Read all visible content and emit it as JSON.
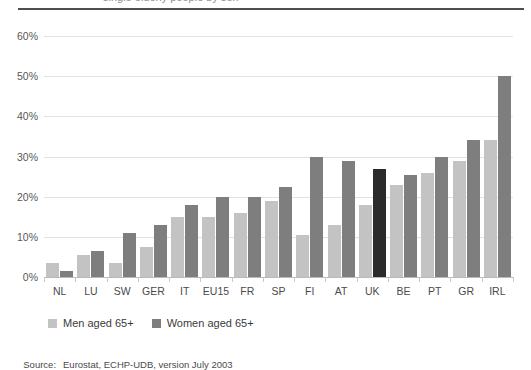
{
  "title_sliver": "single elderly people by sex",
  "chart_data": {
    "type": "bar",
    "title": "",
    "subtitle": "",
    "xlabel": "",
    "ylabel": "",
    "ylim": [
      0,
      60
    ],
    "ytick_labels": [
      "0%",
      "10%",
      "20%",
      "30%",
      "40%",
      "50%",
      "60%"
    ],
    "ytick_values": [
      0,
      10,
      20,
      30,
      40,
      50,
      60
    ],
    "grid": true,
    "legend_position": "bottom-left",
    "categories": [
      "NL",
      "LU",
      "SW",
      "GER",
      "IT",
      "EU15",
      "FR",
      "SP",
      "FI",
      "AT",
      "UK",
      "BE",
      "PT",
      "GR",
      "IRL"
    ],
    "series": [
      {
        "name": "Men aged 65+",
        "color": "#c3c3c3",
        "values": [
          3.5,
          5.5,
          3.5,
          7.5,
          15,
          15,
          16,
          19,
          10.5,
          13,
          18,
          23,
          26,
          29,
          34
        ]
      },
      {
        "name": "Women aged 65+",
        "color": "#7e7e7e",
        "highlight_color": "#2b2b2b",
        "highlight_category": "UK",
        "values": [
          1.5,
          6.5,
          11,
          13,
          18,
          20,
          20,
          22.5,
          30,
          29,
          27,
          25.5,
          30,
          34,
          50
        ]
      }
    ]
  },
  "legend": {
    "items": [
      {
        "label": "Men aged 65+",
        "swatch": "men"
      },
      {
        "label": "Women aged 65+",
        "swatch": "women"
      }
    ]
  },
  "source": {
    "label": "Source:",
    "text": "Eurostat, ECHP-UDB, version July 2003"
  },
  "colors": {
    "men": "#c3c3c3",
    "women": "#7e7e7e",
    "uk_highlight": "#2b2b2b",
    "grid": "#e2e2e2",
    "rule": "#4d4d4d"
  }
}
